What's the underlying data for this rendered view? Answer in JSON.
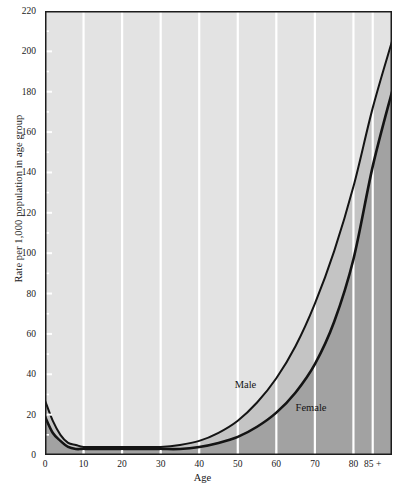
{
  "chart_data": {
    "type": "area",
    "title": "",
    "xlabel": "Age",
    "ylabel": "Rate per 1,000 population in age group",
    "xlim": [
      0,
      90
    ],
    "ylim": [
      0,
      220
    ],
    "grid": "vertical-white-gridlines",
    "legend": "inline-annotations",
    "x_ticks": [
      {
        "value": 0,
        "label": "0"
      },
      {
        "value": 10,
        "label": "10"
      },
      {
        "value": 20,
        "label": "20"
      },
      {
        "value": 30,
        "label": "30"
      },
      {
        "value": 40,
        "label": "40"
      },
      {
        "value": 50,
        "label": "50"
      },
      {
        "value": 60,
        "label": "60"
      },
      {
        "value": 70,
        "label": "70"
      },
      {
        "value": 80,
        "label": "80"
      },
      {
        "value": 85,
        "label": "85 +"
      }
    ],
    "y_ticks": [
      {
        "value": 0,
        "label": "0"
      },
      {
        "value": 20,
        "label": "20"
      },
      {
        "value": 40,
        "label": "40"
      },
      {
        "value": 60,
        "label": "60"
      },
      {
        "value": 80,
        "label": "80"
      },
      {
        "value": 100,
        "label": "100"
      },
      {
        "value": 120,
        "label": "120"
      },
      {
        "value": 140,
        "label": "140"
      },
      {
        "value": 160,
        "label": "160"
      },
      {
        "value": 180,
        "label": "180"
      },
      {
        "value": 200,
        "label": "200"
      },
      {
        "value": 220,
        "label": "220"
      }
    ],
    "y_minor_ticks": [
      10,
      30,
      50,
      70,
      90,
      110,
      130,
      150,
      170,
      190,
      210
    ],
    "x": [
      0,
      2,
      4,
      6,
      8,
      10,
      15,
      20,
      25,
      30,
      35,
      40,
      45,
      50,
      55,
      60,
      65,
      70,
      75,
      80,
      85,
      90
    ],
    "series": [
      {
        "name": "Male",
        "label": "Male",
        "label_x": 52,
        "label_y": 33,
        "values": [
          27,
          17,
          10,
          6,
          5,
          4,
          4,
          4,
          4,
          4,
          5,
          7,
          11,
          17,
          26,
          38,
          54,
          75,
          101,
          133,
          172,
          205
        ]
      },
      {
        "name": "Female",
        "label": "Female",
        "label_x": 69,
        "label_y": 22,
        "values": [
          19,
          11,
          7,
          4,
          3,
          3,
          3,
          3,
          3,
          3,
          3,
          4,
          6,
          9,
          14,
          21,
          31,
          45,
          66,
          97,
          143,
          180
        ]
      }
    ],
    "colors": {
      "plot_background": "#e3e3e3",
      "band_between_curves": "#c4c4c4",
      "fill_below_female": "#a2a2a2",
      "curve_stroke": "#141414",
      "gridline": "#ffffff",
      "frame": "#1c1c1c",
      "text": "#141414"
    }
  }
}
